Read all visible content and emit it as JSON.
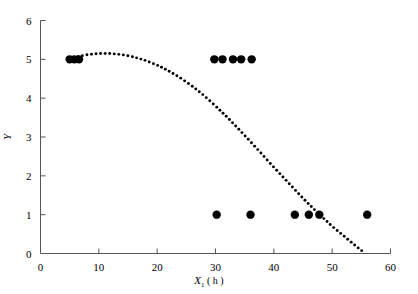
{
  "chart_data": {
    "type": "scatter",
    "title": "",
    "xlabel": "X1 (h)",
    "xlabel_base": "X",
    "xlabel_sub": "1",
    "xlabel_unit": "( h )",
    "ylabel": "Y",
    "xlim": [
      0,
      60
    ],
    "ylim": [
      0,
      6
    ],
    "xticks": [
      0,
      10,
      20,
      30,
      40,
      50,
      60
    ],
    "yticks": [
      0,
      1,
      2,
      3,
      4,
      5,
      6
    ],
    "xtick_labels": [
      "0",
      "10",
      "20",
      "30",
      "40",
      "50",
      "60"
    ],
    "ytick_labels": [
      "0",
      "1",
      "2",
      "3",
      "4",
      "5",
      "6"
    ],
    "grid": false,
    "legend": false,
    "marker": "filled-circle",
    "marker_color": "#000000",
    "points": [
      {
        "x": 5.0,
        "y": 5
      },
      {
        "x": 5.8,
        "y": 5
      },
      {
        "x": 6.6,
        "y": 5
      },
      {
        "x": 29.8,
        "y": 5
      },
      {
        "x": 31.2,
        "y": 5
      },
      {
        "x": 33.0,
        "y": 5
      },
      {
        "x": 34.4,
        "y": 5
      },
      {
        "x": 36.2,
        "y": 5
      },
      {
        "x": 30.2,
        "y": 1
      },
      {
        "x": 36.0,
        "y": 1
      },
      {
        "x": 43.6,
        "y": 1
      },
      {
        "x": 46.0,
        "y": 1
      },
      {
        "x": 47.8,
        "y": 1
      },
      {
        "x": 56.0,
        "y": 1
      }
    ],
    "fitted_curve": {
      "style": "dotted",
      "color": "#000000",
      "x_start": 6.4,
      "x_end": 55.5,
      "points": [
        {
          "x": 6.4,
          "y": 5.07
        },
        {
          "x": 8.0,
          "y": 5.12
        },
        {
          "x": 10.0,
          "y": 5.15
        },
        {
          "x": 12.0,
          "y": 5.15
        },
        {
          "x": 14.0,
          "y": 5.12
        },
        {
          "x": 16.0,
          "y": 5.06
        },
        {
          "x": 18.0,
          "y": 4.97
        },
        {
          "x": 20.0,
          "y": 4.85
        },
        {
          "x": 22.0,
          "y": 4.7
        },
        {
          "x": 24.0,
          "y": 4.52
        },
        {
          "x": 26.0,
          "y": 4.31
        },
        {
          "x": 28.0,
          "y": 4.07
        },
        {
          "x": 30.0,
          "y": 3.8
        },
        {
          "x": 32.0,
          "y": 3.51
        },
        {
          "x": 34.0,
          "y": 3.2
        },
        {
          "x": 36.0,
          "y": 2.88
        },
        {
          "x": 38.0,
          "y": 2.55
        },
        {
          "x": 40.0,
          "y": 2.22
        },
        {
          "x": 42.0,
          "y": 1.9
        },
        {
          "x": 44.0,
          "y": 1.58
        },
        {
          "x": 46.0,
          "y": 1.27
        },
        {
          "x": 48.0,
          "y": 0.98
        },
        {
          "x": 50.0,
          "y": 0.7
        },
        {
          "x": 52.0,
          "y": 0.45
        },
        {
          "x": 54.0,
          "y": 0.2
        },
        {
          "x": 55.5,
          "y": 0.02
        }
      ]
    }
  },
  "axes": {
    "x_axis_name": "x-axis",
    "y_axis_name": "y-axis"
  }
}
